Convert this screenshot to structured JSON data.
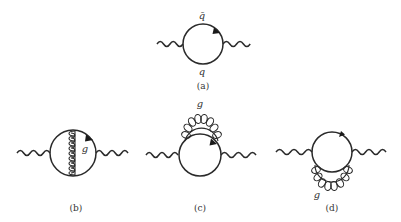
{
  "figure": {
    "diagrams": [
      {
        "id": "a",
        "caption": "(a)",
        "labels": {
          "top": "q̄",
          "bottom": "q"
        },
        "description": "quark loop with two external photon/boson wavy lines"
      },
      {
        "id": "b",
        "caption": "(b)",
        "labels": {
          "gluon": "g"
        },
        "description": "quark loop with internal gluon exchange across the loop"
      },
      {
        "id": "c",
        "caption": "(c)",
        "labels": {
          "gluon": "g"
        },
        "description": "quark loop with gluon self-energy on upper arc"
      },
      {
        "id": "d",
        "caption": "(d)",
        "labels": {
          "gluon": "g"
        },
        "description": "quark loop with gluon self-energy on lower arc"
      }
    ],
    "colors": {
      "stroke": "#2a2a2a",
      "text": "#333333",
      "background": "#ffffff"
    }
  }
}
